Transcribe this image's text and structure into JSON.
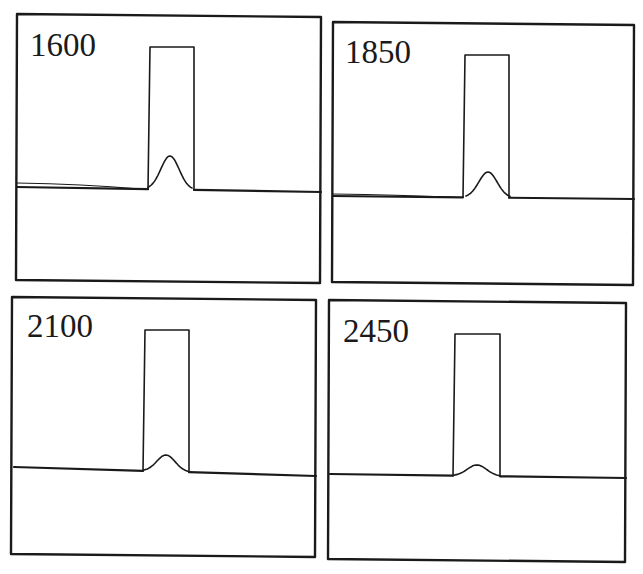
{
  "figure": {
    "width": 643,
    "height": 574,
    "stroke_color": "#1a1a1a",
    "background": "#ffffff"
  },
  "chart_data": {
    "type": "line",
    "title": "",
    "xlabel": "",
    "ylabel": "",
    "grid": false,
    "legend": null,
    "panels": [
      {
        "label": "1600",
        "frame": {
          "x1": 17,
          "y1": 14,
          "x2": 321,
          "y2": 283
        },
        "baseline_left": {
          "x": 17,
          "y": 187
        },
        "baseline_right": {
          "x": 321,
          "y": 192
        },
        "baseline_ghost_left_y": 183,
        "rect": {
          "x1": 148,
          "x2": 194,
          "top": 47,
          "bottom": 190
        },
        "peak": {
          "x": 170,
          "apex_y": 156,
          "half_width": 22
        },
        "relative_peak_height": 0.24
      },
      {
        "label": "1850",
        "frame": {
          "x1": 333,
          "y1": 22,
          "x2": 634,
          "y2": 285
        },
        "baseline_left": {
          "x": 333,
          "y": 196
        },
        "baseline_right": {
          "x": 634,
          "y": 199
        },
        "baseline_ghost_left_y": 194,
        "rect": {
          "x1": 463,
          "x2": 509,
          "top": 55,
          "bottom": 197
        },
        "peak": {
          "x": 488,
          "apex_y": 172,
          "half_width": 22
        },
        "relative_peak_height": 0.18
      },
      {
        "label": "2100",
        "frame": {
          "x1": 12,
          "y1": 297,
          "x2": 316,
          "y2": 557
        },
        "baseline_left": {
          "x": 14,
          "y": 467
        },
        "baseline_right": {
          "x": 316,
          "y": 476
        },
        "baseline_ghost_left_y": null,
        "rect": {
          "x1": 143,
          "x2": 189,
          "top": 330,
          "bottom": 472
        },
        "peak": {
          "x": 166,
          "apex_y": 455,
          "half_width": 22
        },
        "relative_peak_height": 0.12
      },
      {
        "label": "2450",
        "frame": {
          "x1": 329,
          "y1": 300,
          "x2": 626,
          "y2": 562
        },
        "baseline_left": {
          "x": 330,
          "y": 474
        },
        "baseline_right": {
          "x": 626,
          "y": 478
        },
        "baseline_ghost_left_y": null,
        "rect": {
          "x1": 453,
          "x2": 500,
          "top": 334,
          "bottom": 475
        },
        "peak": {
          "x": 477,
          "apex_y": 465,
          "half_width": 23
        },
        "relative_peak_height": 0.07
      }
    ]
  },
  "labels": {
    "panel_1": "1600",
    "panel_2": "1850",
    "panel_3": "2100",
    "panel_4": "2450"
  }
}
